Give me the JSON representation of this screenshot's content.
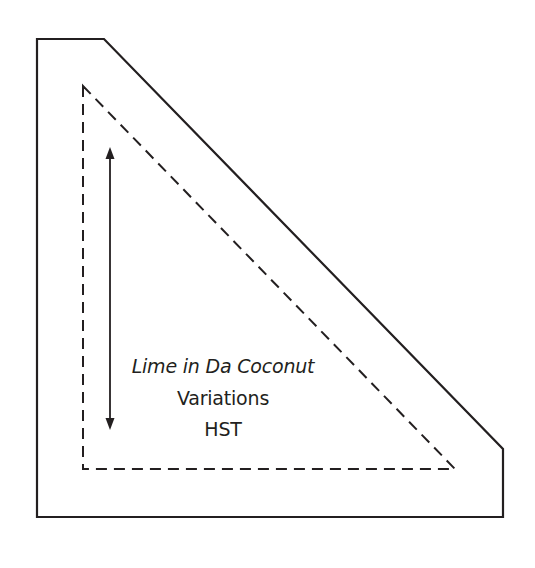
{
  "diagram": {
    "type": "quilt-template",
    "shape": "half-square-triangle with trimmed corner",
    "labels": {
      "pattern_name": "Lime in Da Coconut",
      "subtitle": "Variations",
      "piece": "HST"
    },
    "elements": {
      "outer_cut_line": "solid",
      "inner_sew_line": "dashed",
      "grain_arrow": "vertical double-headed arrow"
    },
    "colors": {
      "stroke": "#231f20",
      "background": "#ffffff"
    }
  }
}
